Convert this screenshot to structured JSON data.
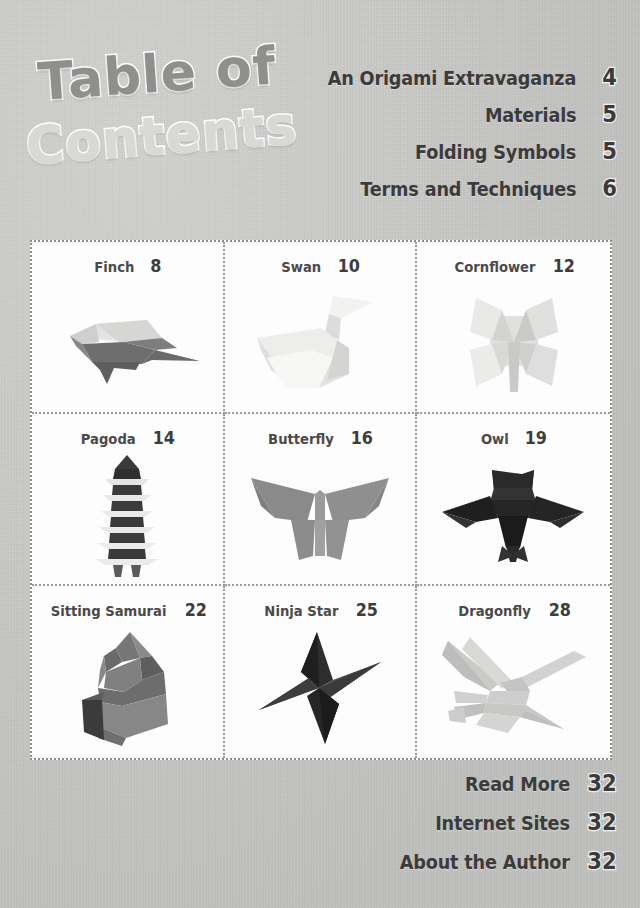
{
  "page": {
    "title_line_1": "Table of",
    "title_line_2": "Contents",
    "background_color": "#c9c9c7",
    "text_color": "#3b3b3b"
  },
  "top_entries": [
    {
      "label": "An Origami Extravaganza",
      "page": "4"
    },
    {
      "label": "Materials",
      "page": "5"
    },
    {
      "label": "Folding Symbols",
      "page": "5"
    },
    {
      "label": "Terms and Techniques",
      "page": "6"
    }
  ],
  "grid": [
    {
      "name": "Finch",
      "page": "8",
      "figure": "finch-origami-figure"
    },
    {
      "name": "Swan",
      "page": "10",
      "figure": "swan-origami-figure"
    },
    {
      "name": "Cornflower",
      "page": "12",
      "figure": "cornflower-origami-figure"
    },
    {
      "name": "Pagoda",
      "page": "14",
      "figure": "pagoda-origami-figure"
    },
    {
      "name": "Butterfly",
      "page": "16",
      "figure": "butterfly-origami-figure"
    },
    {
      "name": "Owl",
      "page": "19",
      "figure": "owl-origami-figure"
    },
    {
      "name": "Sitting Samurai",
      "page": "22",
      "figure": "sitting-samurai-origami-figure"
    },
    {
      "name": "Ninja Star",
      "page": "25",
      "figure": "ninja-star-origami-figure"
    },
    {
      "name": "Dragonfly",
      "page": "28",
      "figure": "dragonfly-origami-figure"
    }
  ],
  "bottom_entries": [
    {
      "label": "Read More",
      "page": "32"
    },
    {
      "label": "Internet Sites",
      "page": "32"
    },
    {
      "label": "About the Author",
      "page": "32"
    }
  ]
}
